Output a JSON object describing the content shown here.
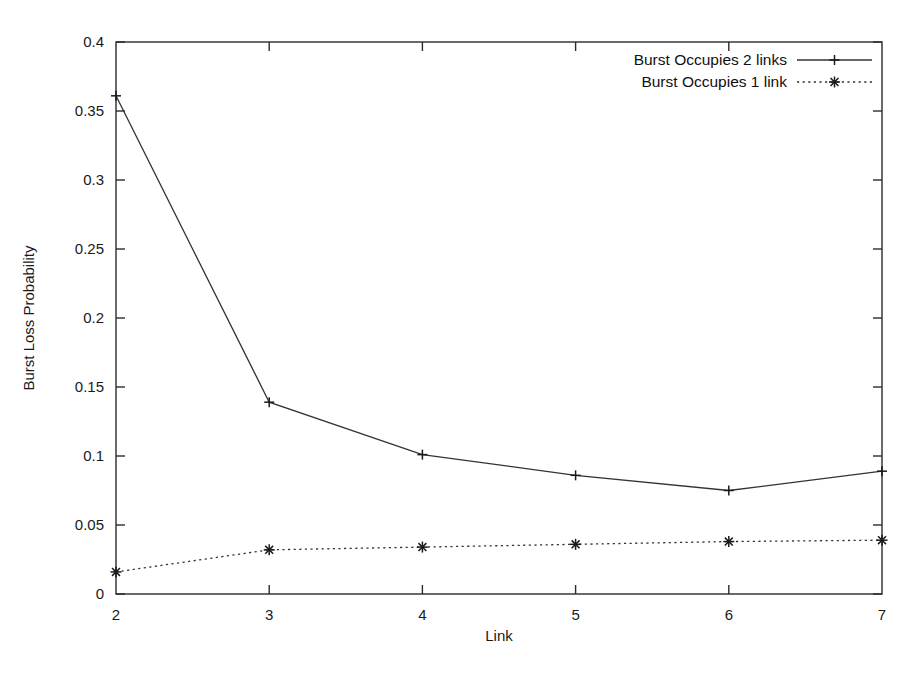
{
  "chart_data": {
    "type": "line",
    "title": "",
    "xlabel": "Link",
    "ylabel": "Burst Loss Probability",
    "x": [
      2,
      3,
      4,
      5,
      6,
      7
    ],
    "xlim": [
      2,
      7
    ],
    "ylim": [
      0,
      0.4
    ],
    "xticks": [
      "2",
      "3",
      "4",
      "5",
      "6",
      "7"
    ],
    "yticks": [
      "0",
      "0.05",
      "0.1",
      "0.15",
      "0.2",
      "0.25",
      "0.3",
      "0.35",
      "0.4"
    ],
    "ytick_values": [
      0,
      0.05,
      0.1,
      0.15,
      0.2,
      0.25,
      0.3,
      0.35,
      0.4
    ],
    "grid": false,
    "legend_position": "top-right",
    "series": [
      {
        "name": "Burst Occupies 2 links",
        "values": [
          0.361,
          0.139,
          0.101,
          0.086,
          0.075,
          0.089
        ],
        "line_style": "solid",
        "marker": "plus",
        "color": "#333333"
      },
      {
        "name": "Burst Occupies 1 link",
        "values": [
          0.016,
          0.032,
          0.034,
          0.036,
          0.038,
          0.039
        ],
        "line_style": "dotted",
        "marker": "asterisk",
        "color": "#333333"
      }
    ]
  },
  "legend": {
    "entries": [
      {
        "label": "Burst Occupies 2 links"
      },
      {
        "label": "Burst Occupies 1 link"
      }
    ]
  },
  "axes": {
    "x_title": "Link",
    "y_title": "Burst Loss Probability"
  }
}
